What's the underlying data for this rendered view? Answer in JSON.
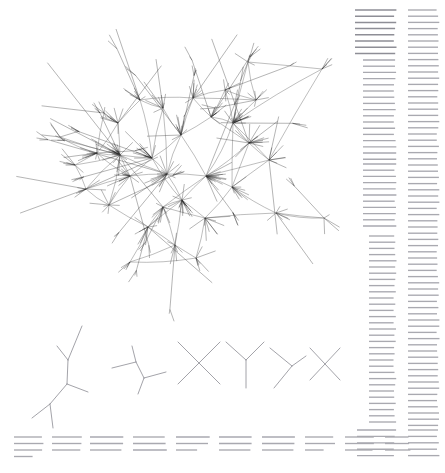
{
  "figure": {
    "background_color": "#ffffff",
    "width": 445,
    "height": 473
  },
  "palette": {
    "edge_color": "#555555",
    "spoke_color": "#1a1a1a",
    "motif_color": "#8c8c93",
    "rule_color": "#a9a9b0",
    "rule_color_strong": "#8e8e96"
  },
  "panels": {
    "network": {
      "name": "main-network-graph",
      "kind": "force-directed-hairball",
      "bounds": [
        10,
        8,
        340,
        300
      ],
      "hub_count": 34,
      "leaf_spokes_per_hub": "6-26"
    },
    "motifs": {
      "name": "graph-motif-row",
      "kind": "small-subgraph-motifs",
      "bounds": [
        10,
        318,
        345,
        110
      ],
      "count": 7
    },
    "legend_columns": {
      "name": "right-rule-columns",
      "kind": "horizontal-rule-columns",
      "bounds": [
        352,
        6,
        93,
        465
      ],
      "columns": 2
    },
    "caption_rules": {
      "name": "bottom-rule-groups",
      "kind": "horizontal-rule-groups",
      "bounds": [
        14,
        432,
        430,
        40
      ],
      "groups": 12
    }
  },
  "chart_data": {
    "type": "scatter",
    "title": "",
    "subtitle": "",
    "xlabel": "",
    "ylabel": "",
    "grid": false,
    "legend_position": "none",
    "xlim": [
      0,
      445
    ],
    "ylim": [
      0,
      473
    ],
    "nodes": [
      {
        "id": 0,
        "x": 120,
        "y": 155,
        "degree": 26
      },
      {
        "id": 1,
        "x": 233,
        "y": 123,
        "degree": 24
      },
      {
        "id": 2,
        "x": 206,
        "y": 176,
        "degree": 20
      },
      {
        "id": 3,
        "x": 182,
        "y": 200,
        "degree": 18
      },
      {
        "id": 4,
        "x": 167,
        "y": 174,
        "degree": 17
      },
      {
        "id": 5,
        "x": 249,
        "y": 143,
        "degree": 16
      },
      {
        "id": 6,
        "x": 152,
        "y": 158,
        "degree": 15
      },
      {
        "id": 7,
        "x": 130,
        "y": 176,
        "degree": 14
      },
      {
        "id": 8,
        "x": 181,
        "y": 135,
        "degree": 13
      },
      {
        "id": 9,
        "x": 97,
        "y": 153,
        "degree": 13
      },
      {
        "id": 10,
        "x": 211,
        "y": 117,
        "degree": 12
      },
      {
        "id": 11,
        "x": 163,
        "y": 207,
        "degree": 12
      },
      {
        "id": 12,
        "x": 193,
        "y": 98,
        "degree": 11
      },
      {
        "id": 13,
        "x": 148,
        "y": 227,
        "degree": 11
      },
      {
        "id": 14,
        "x": 86,
        "y": 189,
        "degree": 10
      },
      {
        "id": 15,
        "x": 232,
        "y": 187,
        "degree": 10
      },
      {
        "id": 16,
        "x": 118,
        "y": 123,
        "degree": 10
      },
      {
        "id": 17,
        "x": 163,
        "y": 108,
        "degree": 9
      },
      {
        "id": 18,
        "x": 205,
        "y": 218,
        "degree": 9
      },
      {
        "id": 19,
        "x": 140,
        "y": 100,
        "degree": 9
      },
      {
        "id": 20,
        "x": 256,
        "y": 100,
        "degree": 8
      },
      {
        "id": 21,
        "x": 175,
        "y": 245,
        "degree": 8
      },
      {
        "id": 22,
        "x": 109,
        "y": 205,
        "degree": 8
      },
      {
        "id": 23,
        "x": 225,
        "y": 90,
        "degree": 7
      },
      {
        "id": 24,
        "x": 196,
        "y": 258,
        "degree": 7
      },
      {
        "id": 25,
        "x": 276,
        "y": 213,
        "degree": 7
      },
      {
        "id": 26,
        "x": 75,
        "y": 165,
        "degree": 7
      },
      {
        "id": 27,
        "x": 104,
        "y": 113,
        "degree": 6
      },
      {
        "id": 28,
        "x": 248,
        "y": 62,
        "degree": 6
      },
      {
        "id": 29,
        "x": 322,
        "y": 69,
        "degree": 5
      },
      {
        "id": 30,
        "x": 324,
        "y": 218,
        "degree": 5
      },
      {
        "id": 31,
        "x": 60,
        "y": 137,
        "degree": 5
      },
      {
        "id": 32,
        "x": 130,
        "y": 262,
        "degree": 5
      },
      {
        "id": 33,
        "x": 269,
        "y": 160,
        "degree": 9
      }
    ],
    "edges": [
      [
        0,
        6
      ],
      [
        0,
        7
      ],
      [
        0,
        9
      ],
      [
        0,
        14
      ],
      [
        0,
        16
      ],
      [
        0,
        26
      ],
      [
        0,
        22
      ],
      [
        0,
        4
      ],
      [
        0,
        31
      ],
      [
        1,
        5
      ],
      [
        1,
        10
      ],
      [
        1,
        2
      ],
      [
        1,
        23
      ],
      [
        1,
        20
      ],
      [
        1,
        28
      ],
      [
        1,
        29
      ],
      [
        1,
        33
      ],
      [
        1,
        15
      ],
      [
        2,
        3
      ],
      [
        2,
        4
      ],
      [
        2,
        5
      ],
      [
        2,
        15
      ],
      [
        2,
        8
      ],
      [
        2,
        11
      ],
      [
        2,
        33
      ],
      [
        3,
        4
      ],
      [
        3,
        11
      ],
      [
        3,
        13
      ],
      [
        3,
        18
      ],
      [
        3,
        6
      ],
      [
        3,
        21
      ],
      [
        4,
        6
      ],
      [
        4,
        8
      ],
      [
        4,
        17
      ],
      [
        4,
        7
      ],
      [
        5,
        10
      ],
      [
        5,
        33
      ],
      [
        5,
        15
      ],
      [
        6,
        8
      ],
      [
        6,
        7
      ],
      [
        6,
        17
      ],
      [
        6,
        19
      ],
      [
        7,
        9
      ],
      [
        7,
        22
      ],
      [
        7,
        14
      ],
      [
        8,
        12
      ],
      [
        8,
        17
      ],
      [
        8,
        10
      ],
      [
        9,
        16
      ],
      [
        9,
        26
      ],
      [
        9,
        27
      ],
      [
        9,
        31
      ],
      [
        10,
        12
      ],
      [
        10,
        23
      ],
      [
        11,
        13
      ],
      [
        11,
        18
      ],
      [
        11,
        21
      ],
      [
        12,
        19
      ],
      [
        12,
        23
      ],
      [
        12,
        20
      ],
      [
        13,
        21
      ],
      [
        13,
        32
      ],
      [
        13,
        22
      ],
      [
        14,
        22
      ],
      [
        14,
        26
      ],
      [
        15,
        18
      ],
      [
        15,
        25
      ],
      [
        15,
        33
      ],
      [
        16,
        19
      ],
      [
        16,
        27
      ],
      [
        17,
        19
      ],
      [
        18,
        24
      ],
      [
        18,
        25
      ],
      [
        20,
        28
      ],
      [
        20,
        23
      ],
      [
        21,
        24
      ],
      [
        21,
        32
      ],
      [
        24,
        32
      ],
      [
        25,
        30
      ],
      [
        28,
        29
      ],
      [
        30,
        25
      ],
      [
        33,
        29
      ]
    ]
  },
  "motifs": [
    {
      "name": "motif-1",
      "label": "large-branching-tree",
      "origin": [
        20,
        318
      ],
      "scale": 1.0,
      "segments": [
        [
          62,
          8,
          48,
          42
        ],
        [
          48,
          42,
          37,
          28
        ],
        [
          48,
          42,
          47,
          66
        ],
        [
          47,
          66,
          68,
          74
        ],
        [
          47,
          66,
          30,
          86
        ],
        [
          30,
          86,
          12,
          100
        ],
        [
          30,
          86,
          33,
          110
        ]
      ]
    },
    {
      "name": "motif-2",
      "label": "medium-branching-tree",
      "origin": [
        108,
        340
      ],
      "scale": 1.0,
      "segments": [
        [
          24,
          6,
          28,
          22
        ],
        [
          28,
          22,
          4,
          28
        ],
        [
          28,
          22,
          36,
          38
        ],
        [
          36,
          38,
          58,
          32
        ],
        [
          36,
          38,
          30,
          54
        ]
      ]
    },
    {
      "name": "motif-3",
      "label": "x-crossing",
      "origin": [
        176,
        338
      ],
      "scale": 1.0,
      "segments": [
        [
          2,
          4,
          44,
          46
        ],
        [
          44,
          4,
          2,
          46
        ]
      ]
    },
    {
      "name": "motif-4",
      "label": "y-junction",
      "origin": [
        224,
        338
      ],
      "scale": 1.0,
      "segments": [
        [
          2,
          4,
          22,
          22
        ],
        [
          40,
          4,
          22,
          22
        ],
        [
          22,
          22,
          22,
          50
        ]
      ]
    },
    {
      "name": "motif-5",
      "label": "tilted-y-junction",
      "origin": [
        268,
        344
      ],
      "scale": 1.0,
      "segments": [
        [
          2,
          4,
          24,
          22
        ],
        [
          24,
          22,
          38,
          12
        ],
        [
          24,
          22,
          6,
          44
        ]
      ]
    },
    {
      "name": "motif-6",
      "label": "small-x-crossing",
      "origin": [
        308,
        344
      ],
      "scale": 1.0,
      "segments": [
        [
          2,
          4,
          32,
          36
        ],
        [
          32,
          4,
          2,
          36
        ]
      ]
    }
  ],
  "rule_columns": [
    {
      "name": "column-left",
      "x": 355,
      "segments": [
        {
          "y_start": 10,
          "y_end": 54,
          "x1": 0,
          "x2": 40,
          "step": 6.2,
          "weight": "strong"
        },
        {
          "y_start": 60,
          "y_end": 160,
          "x1": 8,
          "x2": 40,
          "step": 6.2,
          "weight": "normal"
        },
        {
          "y_start": 164,
          "y_end": 232,
          "x1": 8,
          "x2": 40,
          "step": 6.2,
          "weight": "normal"
        },
        {
          "y_start": 236,
          "y_end": 426,
          "x1": 14,
          "x2": 40,
          "step": 6.2,
          "weight": "normal"
        },
        {
          "y_start": 430,
          "y_end": 458,
          "x1": 2,
          "x2": 40,
          "step": 6.4,
          "weight": "normal"
        }
      ]
    },
    {
      "name": "column-right",
      "x": 408,
      "segments": [
        {
          "y_start": 10,
          "y_end": 426,
          "x1": 0,
          "x2": 30,
          "step": 6.2,
          "weight": "normal"
        },
        {
          "y_start": 430,
          "y_end": 458,
          "x1": 0,
          "x2": 30,
          "step": 6.4,
          "weight": "normal"
        }
      ]
    }
  ],
  "caption_groups": [
    {
      "name": "group-1",
      "x": 14,
      "width": 30,
      "lines": 4,
      "y_start": 437,
      "step": 6.5,
      "short_last": true
    },
    {
      "name": "group-2",
      "x": 52,
      "width": 30,
      "lines": 3,
      "y_start": 437,
      "step": 6.5,
      "short_last": false
    },
    {
      "name": "group-3",
      "x": 90,
      "width": 34,
      "lines": 3,
      "y_start": 437,
      "step": 6.5,
      "short_last": false
    },
    {
      "name": "group-4",
      "x": 133,
      "width": 34,
      "lines": 3,
      "y_start": 437,
      "step": 6.5,
      "short_last": false
    },
    {
      "name": "group-5",
      "x": 176,
      "width": 34,
      "lines": 3,
      "y_start": 437,
      "step": 6.5,
      "short_last": true
    },
    {
      "name": "group-6",
      "x": 219,
      "width": 34,
      "lines": 3,
      "y_start": 437,
      "step": 6.5,
      "short_last": false
    },
    {
      "name": "group-7",
      "x": 262,
      "width": 34,
      "lines": 3,
      "y_start": 437,
      "step": 6.5,
      "short_last": false
    },
    {
      "name": "group-8",
      "x": 305,
      "width": 30,
      "lines": 3,
      "y_start": 437,
      "step": 6.5,
      "short_last": true
    },
    {
      "name": "group-9",
      "x": 345,
      "width": 30,
      "lines": 3,
      "y_start": 437,
      "step": 6.5,
      "short_last": false
    },
    {
      "name": "group-10",
      "x": 385,
      "width": 26,
      "lines": 3,
      "y_start": 437,
      "step": 6.5,
      "short_last": false
    }
  ]
}
